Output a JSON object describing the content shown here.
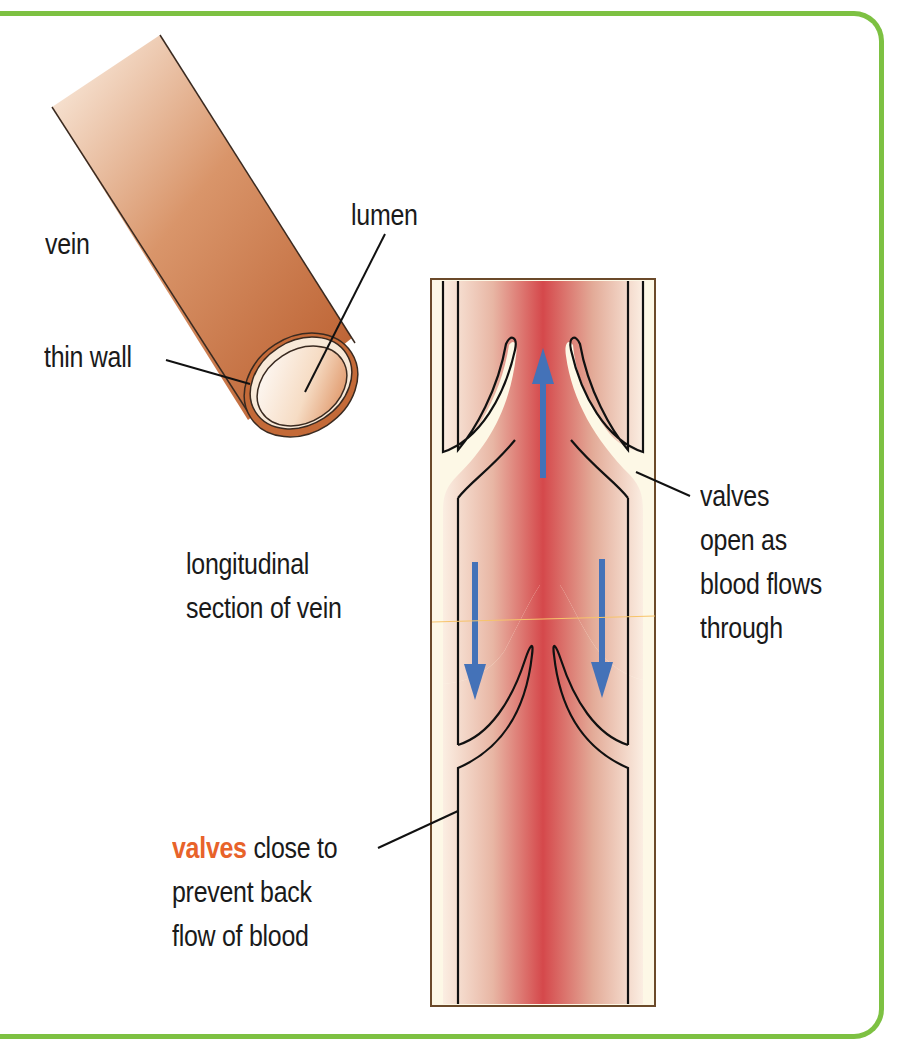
{
  "diagram": {
    "colors": {
      "frame_border": "#7dc142",
      "vein_wall": "#c06a3c",
      "vein_light": "#fbeee0",
      "valve_fill": "#fdf8e6",
      "blood_core": "#d9474a",
      "flow_arrow": "#4472b8",
      "highlight_text": "#e8632a"
    },
    "labels": {
      "vein": "vein",
      "lumen": "lumen",
      "thin_wall": "thin wall",
      "longitudinal_line1": "longitudinal",
      "longitudinal_line2": "section of vein",
      "valves_open_line1": "valves",
      "valves_open_line2": "open as",
      "valves_open_line3": "blood flows",
      "valves_open_line4": "through",
      "valves_close_highlight": "valves",
      "valves_close_line1_rest": " close to",
      "valves_close_line2": "prevent back",
      "valves_close_line3": "flow of blood"
    },
    "arrows": [
      {
        "direction": "up",
        "position": "center-top"
      },
      {
        "direction": "down",
        "position": "left-middle"
      },
      {
        "direction": "down",
        "position": "right-middle"
      }
    ]
  }
}
